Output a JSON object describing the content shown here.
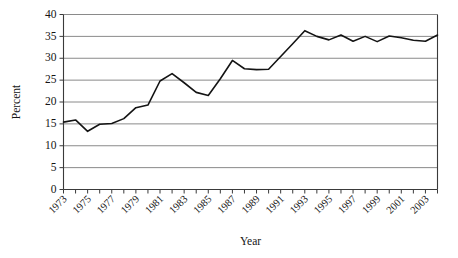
{
  "chart_data": {
    "type": "line",
    "title": "",
    "xlabel": "Year",
    "ylabel": "Percent",
    "xlim": [
      1973,
      2004
    ],
    "ylim": [
      0,
      40
    ],
    "ytick_values": [
      0,
      5,
      10,
      15,
      20,
      25,
      30,
      35,
      40
    ],
    "ytick_labels": [
      "0",
      "5",
      "10",
      "15",
      "20",
      "25",
      "30",
      "35",
      "40"
    ],
    "xtick_values": [
      1973,
      1974,
      1975,
      1976,
      1977,
      1978,
      1979,
      1980,
      1981,
      1982,
      1983,
      1984,
      1985,
      1986,
      1987,
      1988,
      1989,
      1990,
      1991,
      1992,
      1993,
      1994,
      1995,
      1996,
      1997,
      1998,
      1999,
      2000,
      2001,
      2002,
      2003,
      2004
    ],
    "xtick_labels": [
      "1973",
      "",
      "1975",
      "",
      "1977",
      "",
      "1979",
      "",
      "1981",
      "",
      "1983",
      "",
      "1985",
      "",
      "1987",
      "",
      "1989",
      "",
      "1991",
      "",
      "1993",
      "",
      "1995",
      "",
      "1997",
      "",
      "1999",
      "",
      "2001",
      "",
      "2003",
      ""
    ],
    "grid": "horizontal",
    "legend": "none",
    "line_color": "#141414",
    "grid_color": "#8a8a8a",
    "x": [
      1973,
      1974,
      1975,
      1976,
      1977,
      1978,
      1979,
      1980,
      1981,
      1982,
      1983,
      1984,
      1985,
      1986,
      1987,
      1988,
      1989,
      1990,
      1991,
      1992,
      1993,
      1994,
      1995,
      1996,
      1997,
      1998,
      1999,
      2000,
      2001,
      2002,
      2003,
      2004
    ],
    "values": [
      15.4,
      15.9,
      13.3,
      14.9,
      15.1,
      16.2,
      18.7,
      19.3,
      24.8,
      26.5,
      24.4,
      22.2,
      21.5,
      25.3,
      29.5,
      27.6,
      27.4,
      27.5,
      30.4,
      33.3,
      36.3,
      35.0,
      34.2,
      35.3,
      33.9,
      35.0,
      33.8,
      35.1,
      34.7,
      34.1,
      33.9,
      35.3
    ]
  }
}
